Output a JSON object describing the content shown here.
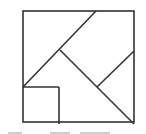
{
  "diagram": {
    "type": "tangram-square-dissection",
    "stroke_color": "#333333",
    "background": "#ffffff",
    "outer_square": {
      "x": 23,
      "y": 11,
      "size": 111
    },
    "segments": [
      {
        "name": "long-diagonal-upper",
        "x1": 23,
        "y1": 87,
        "x2": 96,
        "y2": 11
      },
      {
        "name": "inner-diagonal",
        "x1": 60,
        "y1": 50,
        "x2": 134,
        "y2": 124
      },
      {
        "name": "right-short-diagonal",
        "x1": 134,
        "y1": 51,
        "x2": 97,
        "y2": 87
      },
      {
        "name": "small-square-top",
        "x1": 23,
        "y1": 87,
        "x2": 59,
        "y2": 87
      },
      {
        "name": "small-square-right",
        "x1": 59,
        "y1": 87,
        "x2": 59,
        "y2": 124
      }
    ],
    "caption_fragments": "cropped, illegible"
  }
}
